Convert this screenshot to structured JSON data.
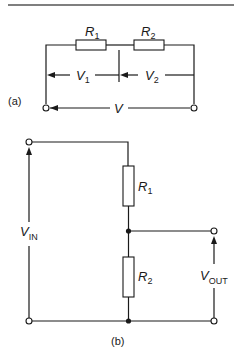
{
  "diagram": {
    "type": "circuit-schematic",
    "colors": {
      "line": "#1a1a1a",
      "background": "#ffffff"
    },
    "part_a": {
      "label": "(a)",
      "resistors": [
        {
          "name": "R",
          "sub": "1"
        },
        {
          "name": "R",
          "sub": "2"
        }
      ],
      "voltages": [
        {
          "name": "V",
          "sub": "1"
        },
        {
          "name": "V",
          "sub": "2"
        },
        {
          "name": "V",
          "sub": ""
        }
      ]
    },
    "part_b": {
      "label": "(b)",
      "resistors": [
        {
          "name": "R",
          "sub": "1"
        },
        {
          "name": "R",
          "sub": "2"
        }
      ],
      "input": {
        "name": "V",
        "sub": "IN"
      },
      "output": {
        "name": "V",
        "sub": "OUT"
      }
    }
  }
}
